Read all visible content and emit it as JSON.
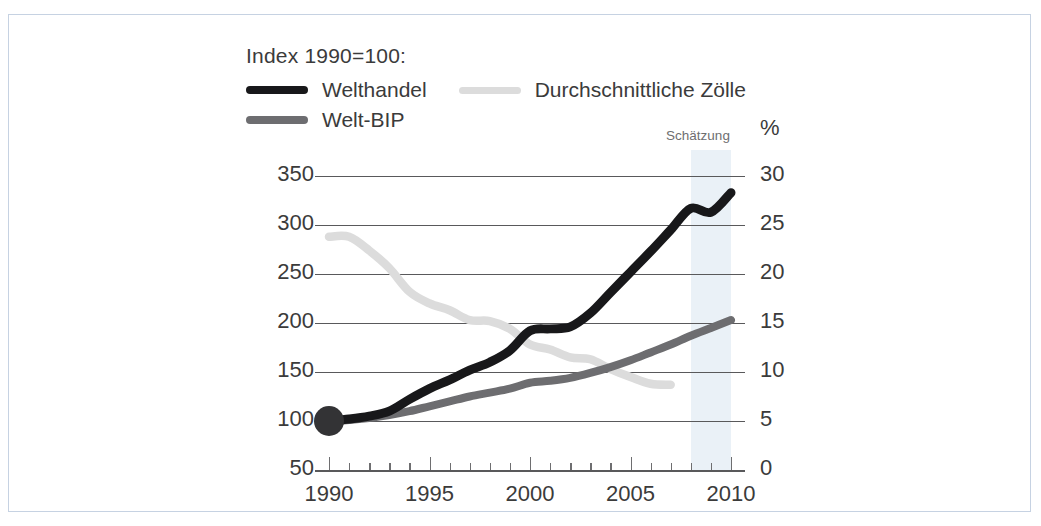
{
  "legend": {
    "title": "Index 1990=100:",
    "entries": [
      {
        "label": "Welthandel",
        "color": "#18181a"
      },
      {
        "label": "Durchschnittliche Zölle",
        "color": "#dcdcdc"
      },
      {
        "label": "Welt-BIP",
        "color": "#6d6d70"
      }
    ]
  },
  "annotation": {
    "estimate": "Schätzung",
    "percent_sign": "%"
  },
  "axes": {
    "left_ticks": [
      "350",
      "300",
      "250",
      "200",
      "150",
      "100",
      "50"
    ],
    "right_ticks": [
      "30",
      "25",
      "20",
      "15",
      "10",
      "5",
      "0"
    ],
    "x_ticks": [
      "1990",
      "1995",
      "2000",
      "2005",
      "2010"
    ]
  },
  "colors": {
    "welthandel": "#18181a",
    "welt_bip": "#6d6d70",
    "zoelle": "#dcdcdc",
    "grid": "#59595b",
    "band": "#dde8f2",
    "frame": "#c6d2e2",
    "text": "#3b3b3b"
  },
  "chart_data": {
    "type": "line",
    "title": "Index 1990=100:",
    "xlabel": "",
    "ylabel": "Index 1990=100",
    "y2label": "%",
    "xlim": [
      1990,
      2010
    ],
    "ylim": [
      50,
      350
    ],
    "y2lim": [
      0,
      30
    ],
    "grid": true,
    "legend_position": "top-left",
    "x": [
      1990,
      1991,
      1992,
      1993,
      1994,
      1995,
      1996,
      1997,
      1998,
      1999,
      2000,
      2001,
      2002,
      2003,
      2004,
      2005,
      2006,
      2007,
      2008,
      2009,
      2010
    ],
    "series": [
      {
        "name": "Welthandel",
        "axis": "left",
        "color": "#18181a",
        "values": [
          100,
          102,
          105,
          110,
          122,
          133,
          142,
          152,
          160,
          172,
          192,
          194,
          196,
          210,
          231,
          252,
          273,
          295,
          317,
          313,
          333
        ]
      },
      {
        "name": "Welt-BIP",
        "axis": "left",
        "color": "#6d6d70",
        "values": [
          100,
          101,
          103,
          106,
          110,
          115,
          120,
          125,
          129,
          133,
          139,
          141,
          144,
          149,
          155,
          162,
          170,
          178,
          187,
          195,
          203
        ]
      },
      {
        "name": "Durchschnittliche Zölle",
        "axis": "right",
        "color": "#dcdcdc",
        "unit": "%",
        "x": [
          1990,
          1991,
          1992,
          1993,
          1994,
          1995,
          1996,
          1997,
          1998,
          1999,
          2000,
          2001,
          2002,
          2003,
          2004,
          2005,
          2006,
          2007
        ],
        "values": [
          23.8,
          23.8,
          22.4,
          20.6,
          18.2,
          17.0,
          16.3,
          15.3,
          15.2,
          14.4,
          12.8,
          12.3,
          11.5,
          11.3,
          10.3,
          9.5,
          8.8,
          8.7
        ]
      }
    ],
    "annotations": [
      {
        "text": "Schätzung",
        "type": "band",
        "x_range": [
          2008,
          2010
        ]
      }
    ]
  }
}
